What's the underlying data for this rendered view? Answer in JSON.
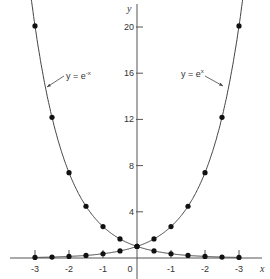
{
  "chart_data": {
    "type": "line",
    "title": "",
    "xlabel": "x",
    "ylabel": "y",
    "xlim": [
      -3.1,
      3.5
    ],
    "ylim": [
      0,
      21.5
    ],
    "grid": false,
    "x_ticks": [
      {
        "value": -3,
        "label": "-3"
      },
      {
        "value": -2,
        "label": "-2"
      },
      {
        "value": -1,
        "label": "-1"
      },
      {
        "value": 0,
        "label": "0"
      },
      {
        "value": 1,
        "label": "-1"
      },
      {
        "value": 2,
        "label": "-2"
      },
      {
        "value": 3,
        "label": "-3"
      }
    ],
    "y_ticks": [
      {
        "value": 4,
        "label": "4"
      },
      {
        "value": 8,
        "label": "8"
      },
      {
        "value": 12,
        "label": "12"
      },
      {
        "value": 16,
        "label": "16"
      },
      {
        "value": 20,
        "label": "20"
      }
    ],
    "series": [
      {
        "name": "y = e^-x",
        "label_base": "y = e",
        "label_exp": "-x",
        "x": [
          -3,
          -2.5,
          -2,
          -1.5,
          -1,
          -0.5,
          0,
          0.5,
          1,
          1.5,
          2,
          2.5,
          3
        ],
        "values": [
          20.09,
          12.18,
          7.39,
          4.48,
          2.72,
          1.65,
          1.0,
          0.61,
          0.37,
          0.22,
          0.14,
          0.08,
          0.05
        ]
      },
      {
        "name": "y = e^x",
        "label_base": "y = e",
        "label_exp": "x",
        "x": [
          -3,
          -2.5,
          -2,
          -1.5,
          -1,
          -0.5,
          0,
          0.5,
          1,
          1.5,
          2,
          2.5,
          3
        ],
        "values": [
          0.05,
          0.08,
          0.14,
          0.22,
          0.37,
          0.61,
          1.0,
          1.65,
          2.72,
          4.48,
          7.39,
          12.18,
          20.09
        ]
      }
    ],
    "annotations": [
      {
        "text": "y = e^-x",
        "points_to_series": 0
      },
      {
        "text": "y = e^x",
        "points_to_series": 1
      }
    ]
  }
}
